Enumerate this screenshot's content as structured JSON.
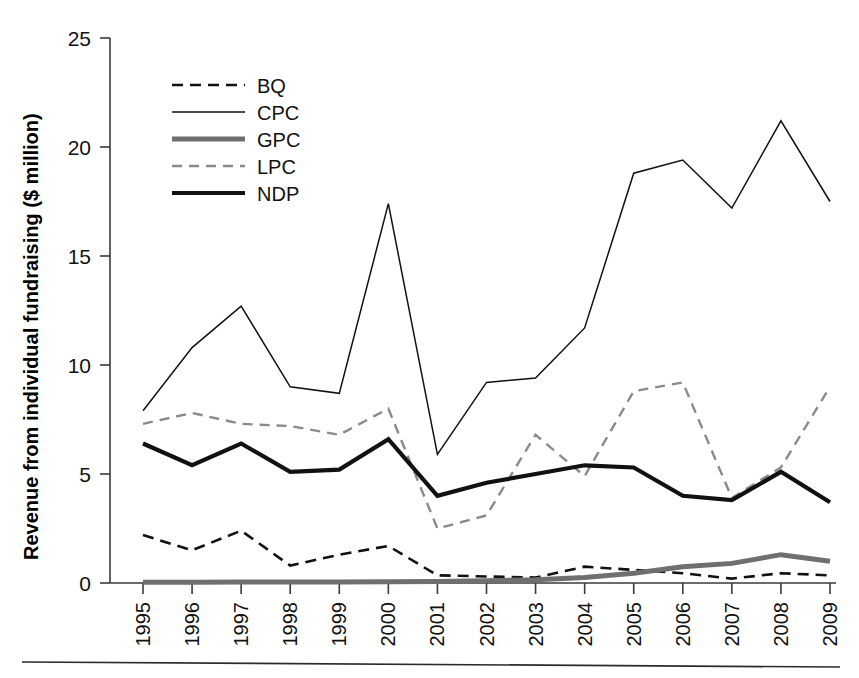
{
  "chart_data": {
    "type": "line",
    "title": "",
    "xlabel": "",
    "ylabel": "Revenue from individual fundraising ($ million)",
    "categories": [
      "1995",
      "1996",
      "1997",
      "1998",
      "1999",
      "2000",
      "2001",
      "2002",
      "2003",
      "2004",
      "2005",
      "2006",
      "2007",
      "2008",
      "2009"
    ],
    "x": [
      1995,
      1996,
      1997,
      1998,
      1999,
      2000,
      2001,
      2002,
      2003,
      2004,
      2005,
      2006,
      2007,
      2008,
      2009
    ],
    "ylim": [
      0,
      25
    ],
    "yticks": [
      0,
      5,
      10,
      15,
      20,
      25
    ],
    "ytick_labels": [
      "0",
      "5",
      "10",
      "15",
      "20",
      "25"
    ],
    "grid": false,
    "legend_position": "upper-left-inside",
    "series": [
      {
        "name": "BQ",
        "style": "dashed",
        "color": "#111111",
        "width": 2.6,
        "dash": "11,7",
        "values": [
          2.2,
          1.5,
          2.4,
          0.8,
          1.3,
          1.7,
          0.35,
          0.3,
          0.25,
          0.75,
          0.6,
          0.45,
          0.2,
          0.45,
          0.35
        ]
      },
      {
        "name": "CPC",
        "style": "solid-thin",
        "color": "#111111",
        "width": 1.5,
        "dash": "",
        "values": [
          7.9,
          10.8,
          12.7,
          9.0,
          8.7,
          17.4,
          5.9,
          9.2,
          9.4,
          11.7,
          18.8,
          19.4,
          17.2,
          21.2,
          17.5
        ]
      },
      {
        "name": "GPC",
        "style": "solid-thick-gray",
        "color": "#6f6f6f",
        "width": 5.0,
        "dash": "",
        "values": [
          0.04,
          0.04,
          0.05,
          0.05,
          0.05,
          0.06,
          0.07,
          0.1,
          0.15,
          0.25,
          0.45,
          0.75,
          0.9,
          1.3,
          1.0
        ]
      },
      {
        "name": "LPC",
        "style": "dashed-gray",
        "color": "#8a8a8a",
        "width": 2.4,
        "dash": "10,7",
        "values": [
          7.3,
          7.8,
          7.3,
          7.2,
          6.8,
          8.0,
          2.5,
          3.1,
          6.8,
          4.9,
          8.8,
          9.2,
          3.9,
          5.3,
          9.0
        ]
      },
      {
        "name": "NDP",
        "style": "solid-thick",
        "color": "#111111",
        "width": 4.2,
        "dash": "",
        "values": [
          6.4,
          5.4,
          6.4,
          5.1,
          5.2,
          6.6,
          4.0,
          4.6,
          5.0,
          5.4,
          5.3,
          4.0,
          3.8,
          5.1,
          3.7
        ]
      }
    ],
    "legend": [
      {
        "label": "BQ"
      },
      {
        "label": "CPC"
      },
      {
        "label": "GPC"
      },
      {
        "label": "LPC"
      },
      {
        "label": "NDP"
      }
    ]
  }
}
